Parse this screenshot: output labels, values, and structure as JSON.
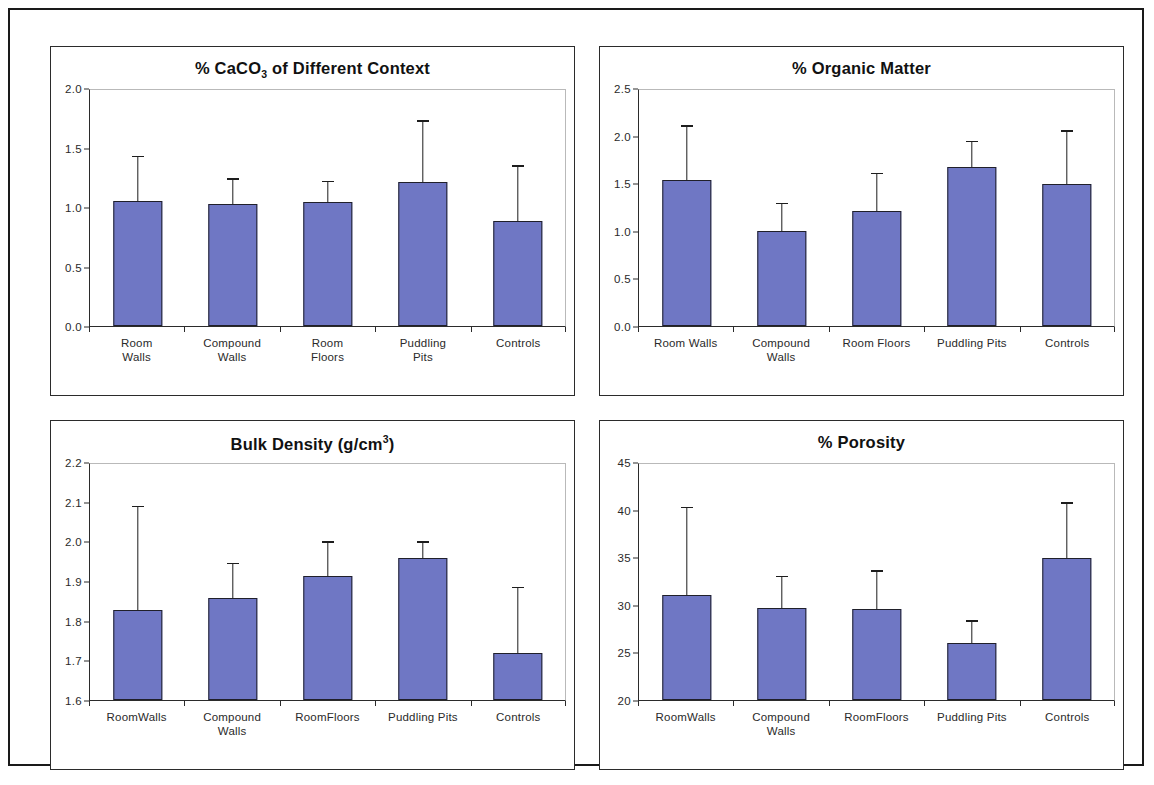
{
  "figure": {
    "bar_color": "#6f77c4",
    "bar_outline_color": "#20202a",
    "axis_color": "#2b2b2b",
    "background": "#ffffff",
    "panel_border_color": "#2b2b2b",
    "outer_border_color": "#1a1a1a"
  },
  "chart_data": [
    {
      "id": "caco3",
      "type": "bar",
      "title": "% CaCO3 of Different Context",
      "title_parts": {
        "pre": "% CaCO",
        "sub": "3",
        "post": " of Different Context"
      },
      "xlabel": "",
      "ylabel": "",
      "ylim": [
        0.0,
        2.0
      ],
      "yticks": [
        "0.0",
        "0.5",
        "1.0",
        "1.5",
        "2.0"
      ],
      "ytick_values": [
        0.0,
        0.5,
        1.0,
        1.5,
        2.0
      ],
      "grid": false,
      "legend": "none",
      "categories": [
        "Room Walls",
        "Compound Walls",
        "Room Floors",
        "Puddling Pits",
        "Controls"
      ],
      "category_lines": [
        [
          "Room",
          "Walls"
        ],
        [
          "Compound",
          "Walls"
        ],
        [
          "Room",
          "Floors"
        ],
        [
          "Puddling",
          "Pits"
        ],
        [
          "Controls",
          ""
        ]
      ],
      "values": [
        1.06,
        1.03,
        1.05,
        1.22,
        0.89
      ],
      "errors": [
        0.37,
        0.21,
        0.17,
        0.51,
        0.46
      ]
    },
    {
      "id": "organic-matter",
      "type": "bar",
      "title": "% Organic Matter",
      "title_parts": {
        "pre": "% Organic Matter",
        "sub": "",
        "post": ""
      },
      "xlabel": "",
      "ylabel": "",
      "ylim": [
        0.0,
        2.5
      ],
      "yticks": [
        "0.0",
        "0.5",
        "1.0",
        "1.5",
        "2.0",
        "2.5"
      ],
      "ytick_values": [
        0.0,
        0.5,
        1.0,
        1.5,
        2.0,
        2.5
      ],
      "grid": false,
      "legend": "none",
      "categories": [
        "Room Walls",
        "Compound Walls",
        "Room Floors",
        "Puddling Pits",
        "Controls"
      ],
      "category_lines": [
        [
          "Room Walls",
          ""
        ],
        [
          "Compound",
          "Walls"
        ],
        [
          "Room Floors",
          ""
        ],
        [
          "Puddling Pits",
          ""
        ],
        [
          "Controls",
          ""
        ]
      ],
      "values": [
        1.55,
        1.01,
        1.22,
        1.68,
        1.5
      ],
      "errors": [
        0.56,
        0.28,
        0.39,
        0.27,
        0.56
      ]
    },
    {
      "id": "bulk-density",
      "type": "bar",
      "title": "Bulk Density (g/cm3)",
      "title_parts": {
        "pre": "Bulk Density (g/cm",
        "sup": "3",
        "post": ")"
      },
      "xlabel": "",
      "ylabel": "",
      "ylim": [
        1.6,
        2.2
      ],
      "yticks": [
        "1.6",
        "1.7",
        "1.8",
        "1.9",
        "2.0",
        "2.1",
        "2.2"
      ],
      "ytick_values": [
        1.6,
        1.7,
        1.8,
        1.9,
        2.0,
        2.1,
        2.2
      ],
      "grid": false,
      "legend": "none",
      "categories": [
        "Room Walls",
        "Compound Walls",
        "Room Floors",
        "Puddling Pits",
        "Controls"
      ],
      "category_lines": [
        [
          "RoomWalls",
          ""
        ],
        [
          "Compound",
          "Walls"
        ],
        [
          "RoomFloors",
          ""
        ],
        [
          "Puddling Pits",
          ""
        ],
        [
          "Controls",
          ""
        ]
      ],
      "values": [
        1.83,
        1.86,
        1.915,
        1.96,
        1.72
      ],
      "errors": [
        0.26,
        0.085,
        0.085,
        0.04,
        0.165
      ]
    },
    {
      "id": "porosity",
      "type": "bar",
      "title": "% Porosity",
      "title_parts": {
        "pre": "% Porosity",
        "sub": "",
        "post": ""
      },
      "xlabel": "",
      "ylabel": "",
      "ylim": [
        20,
        45
      ],
      "yticks": [
        "20",
        "25",
        "30",
        "35",
        "40",
        "45"
      ],
      "ytick_values": [
        20,
        25,
        30,
        35,
        40,
        45
      ],
      "grid": false,
      "legend": "none",
      "categories": [
        "Room Walls",
        "Compound Walls",
        "Room Floors",
        "Puddling Pits",
        "Controls"
      ],
      "category_lines": [
        [
          "RoomWalls",
          ""
        ],
        [
          "Compound",
          "Walls"
        ],
        [
          "RoomFloors",
          ""
        ],
        [
          "Puddling Pits",
          ""
        ],
        [
          "Controls",
          ""
        ]
      ],
      "values": [
        31.1,
        29.7,
        29.6,
        26.0,
        35.0
      ],
      "errors": [
        9.2,
        3.3,
        4.0,
        2.3,
        5.8
      ]
    }
  ]
}
